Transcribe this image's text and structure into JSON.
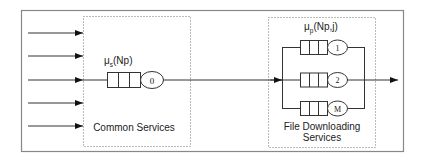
{
  "diagram": {
    "common": {
      "label": "Common Services",
      "rate_symbol": "μ",
      "rate_sub": "s",
      "rate_arg": "(Np)",
      "server_label": "0"
    },
    "download": {
      "label_line1": "File Downloading",
      "label_line2": "Services",
      "rate_symbol": "μ",
      "rate_sub": "p",
      "rate_arg": "(Np,j)",
      "servers": [
        {
          "label": "1"
        },
        {
          "label": "2"
        },
        {
          "label": "M"
        }
      ]
    },
    "colors": {
      "line": "#333333",
      "frame": "#888888",
      "dotted": "#777777"
    }
  }
}
